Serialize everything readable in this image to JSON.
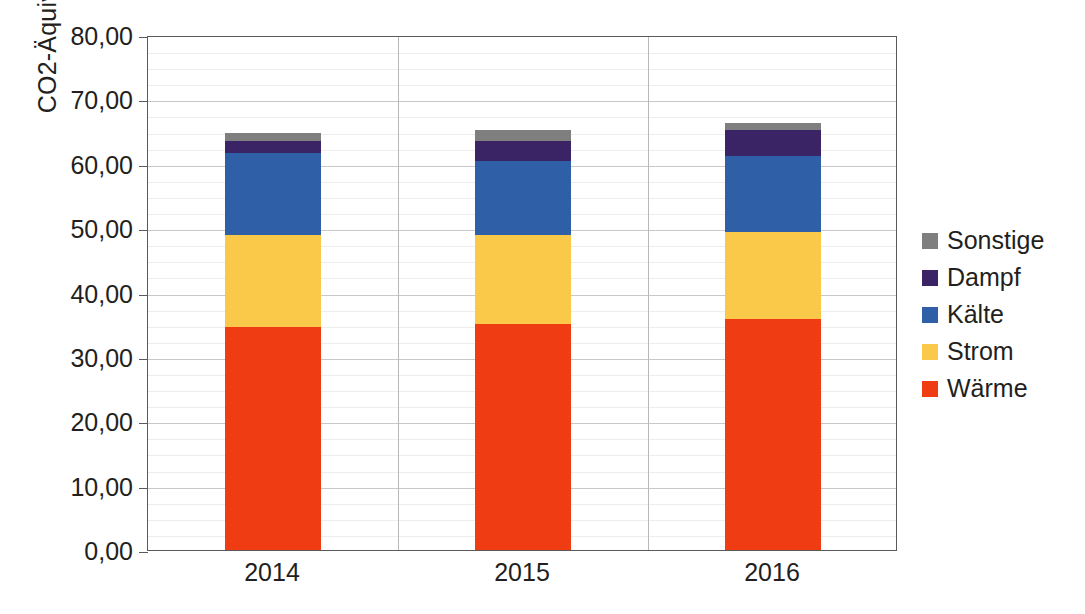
{
  "chart_data": {
    "type": "bar",
    "subtype": "stacked-bar",
    "title": "",
    "xlabel": "",
    "ylabel": "CO2-Äquivalente [kg/m²]",
    "categories": [
      "2014",
      "2015",
      "2016"
    ],
    "series": [
      {
        "name": "Wärme",
        "color": "#F03C12",
        "values": [
          34.6,
          35.1,
          35.9
        ]
      },
      {
        "name": "Strom",
        "color": "#FBC94A",
        "values": [
          14.3,
          13.8,
          13.5
        ]
      },
      {
        "name": "Kälte",
        "color": "#2F5FA6",
        "values": [
          12.7,
          11.5,
          11.8
        ]
      },
      {
        "name": "Dampf",
        "color": "#3B2465",
        "values": [
          2.0,
          3.1,
          4.0
        ]
      },
      {
        "name": "Sonstige",
        "color": "#7F7F7F",
        "values": [
          1.2,
          1.7,
          1.2
        ]
      }
    ],
    "stack_order_bottom_to_top": [
      "Wärme",
      "Strom",
      "Kälte",
      "Dampf",
      "Sonstige"
    ],
    "totals": [
      64.8,
      65.2,
      66.4
    ],
    "ylim": [
      0,
      80
    ],
    "ytick_step": 10,
    "ytick_labels": [
      "80,00",
      "70,00",
      "60,00",
      "50,00",
      "40,00",
      "30,00",
      "20,00",
      "10,00",
      "0,00"
    ],
    "ytick_values": [
      80,
      70,
      60,
      50,
      40,
      30,
      20,
      10,
      0
    ],
    "minor_gridlines_per_major": 4,
    "grid": true,
    "legend_position": "right",
    "legend_entries": [
      "Sonstige",
      "Dampf",
      "Kälte",
      "Strom",
      "Wärme"
    ],
    "decimal_separator": ","
  },
  "legend": {
    "items": [
      {
        "label": "Sonstige",
        "color": "#7F7F7F"
      },
      {
        "label": "Dampf",
        "color": "#3B2465"
      },
      {
        "label": "Kälte",
        "color": "#2F5FA6"
      },
      {
        "label": "Strom",
        "color": "#FBC94A"
      },
      {
        "label": "Wärme",
        "color": "#F03C12"
      }
    ]
  },
  "axes": {
    "y_title": "CO2-Äquivalente [kg/m²]",
    "y_labels": [
      "80,00",
      "70,00",
      "60,00",
      "50,00",
      "40,00",
      "30,00",
      "20,00",
      "10,00",
      "0,00"
    ],
    "x_labels": [
      "2014",
      "2015",
      "2016"
    ]
  }
}
